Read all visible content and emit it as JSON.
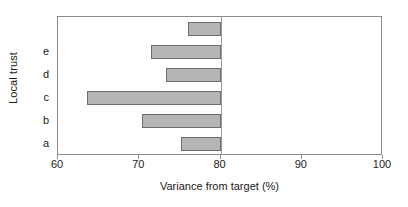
{
  "chart_data": {
    "type": "bar",
    "orientation": "horizontal",
    "title": "",
    "xlabel": "Variance from target (%)",
    "ylabel": "Local trust",
    "xlim": [
      60,
      100
    ],
    "xticks": [
      60,
      70,
      80,
      90,
      100
    ],
    "xtick_labels": [
      "60",
      "70",
      "80",
      "90",
      "100"
    ],
    "grid": false,
    "legend": null,
    "baseline": 80,
    "baseline_note": "bars extend leftward from the 80% target line",
    "categories": [
      "a",
      "b",
      "c",
      "d",
      "e",
      ""
    ],
    "category_labels_bottom_to_top": [
      "a",
      "b",
      "c",
      "d",
      "e",
      ""
    ],
    "values": [
      75.1,
      70.3,
      63.6,
      73.3,
      71.4,
      76.0
    ],
    "series": [
      {
        "name": "Variance from target (%)",
        "values": [
          75.1,
          70.3,
          63.6,
          73.3,
          71.4,
          76.0
        ]
      }
    ],
    "bars": [
      {
        "category": "",
        "value": 76.0,
        "row_from_top": 0
      },
      {
        "category": "e",
        "value": 71.4,
        "row_from_top": 1
      },
      {
        "category": "d",
        "value": 73.3,
        "row_from_top": 2
      },
      {
        "category": "c",
        "value": 63.6,
        "row_from_top": 3
      },
      {
        "category": "b",
        "value": 70.3,
        "row_from_top": 4
      },
      {
        "category": "a",
        "value": 75.1,
        "row_from_top": 5
      }
    ],
    "colors": {
      "bar_fill": "#b5b5b5",
      "bar_border": "#6e6e6e",
      "axis": "#8c8c8c",
      "text": "#1a1a1a",
      "background": "#ffffff"
    }
  }
}
